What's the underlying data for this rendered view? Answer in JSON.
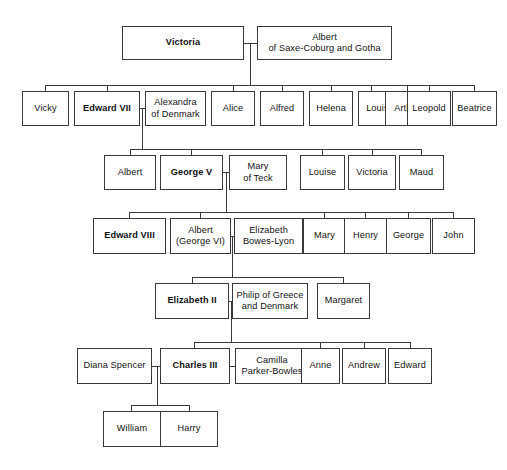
{
  "diagram": {
    "background_color": "#ffffff",
    "line_color": "#3a3a3a",
    "text_color": "#111111"
  },
  "nodes": [
    {
      "id": "victoria",
      "label": "Victoria",
      "monarch": true,
      "x": 122,
      "y": 26,
      "w": 122,
      "h": 34
    },
    {
      "id": "albert_sc",
      "label": "Albert\nof Saxe-Coburg and Gotha",
      "monarch": false,
      "x": 257,
      "y": 26,
      "w": 135,
      "h": 34
    },
    {
      "id": "vicky",
      "label": "Vicky",
      "monarch": false,
      "x": 22,
      "y": 91,
      "w": 47,
      "h": 35
    },
    {
      "id": "edward7",
      "label": "Edward VII",
      "monarch": true,
      "x": 74,
      "y": 91,
      "w": 66,
      "h": 35
    },
    {
      "id": "alexandra",
      "label": "Alexandra\nof Denmark",
      "monarch": false,
      "x": 145,
      "y": 91,
      "w": 61,
      "h": 35
    },
    {
      "id": "alice",
      "label": "Alice",
      "monarch": false,
      "x": 211,
      "y": 91,
      "w": 44,
      "h": 35
    },
    {
      "id": "alfred",
      "label": "Alfred",
      "monarch": false,
      "x": 260,
      "y": 91,
      "w": 44,
      "h": 35
    },
    {
      "id": "helena",
      "label": "Helena",
      "monarch": false,
      "x": 309,
      "y": 91,
      "w": 44,
      "h": 35
    },
    {
      "id": "louise1",
      "label": "Louise",
      "monarch": false,
      "x": 358,
      "y": 91,
      "w": 44,
      "h": 35
    },
    {
      "id": "arthur",
      "label": "Arthur",
      "monarch": false,
      "x": 385,
      "y": 91,
      "w": 44,
      "h": 35
    },
    {
      "id": "leopold",
      "label": "Leopold",
      "monarch": false,
      "x": 407,
      "y": 91,
      "w": 44,
      "h": 35
    },
    {
      "id": "beatrice",
      "label": "Beatrice",
      "monarch": false,
      "x": 452,
      "y": 91,
      "w": 45,
      "h": 35
    },
    {
      "id": "albert2",
      "label": "Albert",
      "monarch": false,
      "x": 104,
      "y": 155,
      "w": 52,
      "h": 35
    },
    {
      "id": "george5",
      "label": "George V",
      "monarch": true,
      "x": 160,
      "y": 155,
      "w": 63,
      "h": 35
    },
    {
      "id": "mary_teck",
      "label": "Mary\nof Teck",
      "monarch": false,
      "x": 229,
      "y": 155,
      "w": 58,
      "h": 35
    },
    {
      "id": "louise2",
      "label": "Louise",
      "monarch": false,
      "x": 300,
      "y": 155,
      "w": 45,
      "h": 35
    },
    {
      "id": "victoria2",
      "label": "Victoria",
      "monarch": false,
      "x": 348,
      "y": 155,
      "w": 48,
      "h": 35
    },
    {
      "id": "maud",
      "label": "Maud",
      "monarch": false,
      "x": 399,
      "y": 155,
      "w": 45,
      "h": 35
    },
    {
      "id": "edward8",
      "label": "Edward VIII",
      "monarch": true,
      "x": 93,
      "y": 218,
      "w": 73,
      "h": 36
    },
    {
      "id": "albert_g6",
      "label": "Albert\n(George VI)",
      "monarch": false,
      "x": 170,
      "y": 218,
      "w": 61,
      "h": 36
    },
    {
      "id": "bowes_lyon",
      "label": "Elizabeth\nBowes-Lyon",
      "monarch": false,
      "x": 234,
      "y": 218,
      "w": 69,
      "h": 36
    },
    {
      "id": "mary2",
      "label": "Mary",
      "monarch": false,
      "x": 303,
      "y": 218,
      "w": 43,
      "h": 36
    },
    {
      "id": "henry",
      "label": "Henry",
      "monarch": false,
      "x": 344,
      "y": 218,
      "w": 43,
      "h": 36
    },
    {
      "id": "george2",
      "label": "George",
      "monarch": false,
      "x": 386,
      "y": 218,
      "w": 45,
      "h": 36
    },
    {
      "id": "john",
      "label": "John",
      "monarch": false,
      "x": 432,
      "y": 218,
      "w": 43,
      "h": 36
    },
    {
      "id": "elizabeth2",
      "label": "Elizabeth II",
      "monarch": true,
      "x": 155,
      "y": 283,
      "w": 74,
      "h": 36
    },
    {
      "id": "philip",
      "label": "Philip of Greece\nand Denmark",
      "monarch": false,
      "x": 232,
      "y": 283,
      "w": 76,
      "h": 36
    },
    {
      "id": "margaret",
      "label": "Margaret",
      "monarch": false,
      "x": 317,
      "y": 283,
      "w": 53,
      "h": 36
    },
    {
      "id": "diana",
      "label": "Diana Spencer",
      "monarch": false,
      "x": 77,
      "y": 348,
      "w": 75,
      "h": 36
    },
    {
      "id": "charles3",
      "label": "Charles III",
      "monarch": true,
      "x": 160,
      "y": 348,
      "w": 70,
      "h": 36
    },
    {
      "id": "camilla",
      "label": "Camilla\nParker-Bowles",
      "monarch": false,
      "x": 235,
      "y": 348,
      "w": 74,
      "h": 36
    },
    {
      "id": "anne",
      "label": "Anne",
      "monarch": false,
      "x": 301,
      "y": 348,
      "w": 39,
      "h": 36
    },
    {
      "id": "andrew",
      "label": "Andrew",
      "monarch": false,
      "x": 342,
      "y": 348,
      "w": 44,
      "h": 36
    },
    {
      "id": "edward_p",
      "label": "Edward",
      "monarch": false,
      "x": 388,
      "y": 348,
      "w": 44,
      "h": 36
    },
    {
      "id": "william",
      "label": "William",
      "monarch": false,
      "x": 103,
      "y": 411,
      "w": 58,
      "h": 36
    },
    {
      "id": "harry",
      "label": "Harry",
      "monarch": false,
      "x": 160,
      "y": 411,
      "w": 58,
      "h": 36
    }
  ],
  "edges": [
    {
      "id": "m-victoria-albert-h",
      "orient": "h",
      "x": 244,
      "y": 43,
      "len": 14
    },
    {
      "id": "m-victoria-albert-v",
      "orient": "v",
      "x": 250,
      "y": 43,
      "len": 42
    },
    {
      "id": "bus-gen2",
      "orient": "h",
      "x": 45,
      "y": 85,
      "len": 430
    },
    {
      "id": "drop-vicky",
      "orient": "v",
      "x": 45,
      "y": 85,
      "len": 6
    },
    {
      "id": "drop-edward7",
      "orient": "v",
      "x": 107,
      "y": 85,
      "len": 6
    },
    {
      "id": "drop-alice",
      "orient": "v",
      "x": 233,
      "y": 85,
      "len": 6
    },
    {
      "id": "drop-alfred",
      "orient": "v",
      "x": 282,
      "y": 85,
      "len": 6
    },
    {
      "id": "drop-helena",
      "orient": "v",
      "x": 331,
      "y": 85,
      "len": 6
    },
    {
      "id": "drop-louise1",
      "orient": "v",
      "x": 371,
      "y": 85,
      "len": 6
    },
    {
      "id": "drop-arthur",
      "orient": "v",
      "x": 407,
      "y": 85,
      "len": 6
    },
    {
      "id": "drop-leopold",
      "orient": "v",
      "x": 429,
      "y": 85,
      "len": 6
    },
    {
      "id": "drop-beatrice",
      "orient": "v",
      "x": 474,
      "y": 85,
      "len": 6
    },
    {
      "id": "m-edward7-alex-h",
      "orient": "h",
      "x": 140,
      "y": 108,
      "len": 5
    },
    {
      "id": "m-edward7-alex-v",
      "orient": "v",
      "x": 142,
      "y": 108,
      "len": 41
    },
    {
      "id": "bus-gen3",
      "orient": "h",
      "x": 130,
      "y": 149,
      "len": 292
    },
    {
      "id": "drop-albert2",
      "orient": "v",
      "x": 130,
      "y": 149,
      "len": 6
    },
    {
      "id": "drop-george5",
      "orient": "v",
      "x": 191,
      "y": 149,
      "len": 6
    },
    {
      "id": "drop-louise2",
      "orient": "v",
      "x": 322,
      "y": 149,
      "len": 6
    },
    {
      "id": "drop-victoria2",
      "orient": "v",
      "x": 372,
      "y": 149,
      "len": 6
    },
    {
      "id": "drop-maud",
      "orient": "v",
      "x": 421,
      "y": 149,
      "len": 6
    },
    {
      "id": "m-george5-mary-h",
      "orient": "h",
      "x": 223,
      "y": 172,
      "len": 6
    },
    {
      "id": "m-george5-mary-v",
      "orient": "v",
      "x": 226,
      "y": 172,
      "len": 40
    },
    {
      "id": "bus-gen4",
      "orient": "h",
      "x": 129,
      "y": 212,
      "len": 325
    },
    {
      "id": "drop-edward8",
      "orient": "v",
      "x": 129,
      "y": 212,
      "len": 6
    },
    {
      "id": "drop-albert-g6",
      "orient": "v",
      "x": 200,
      "y": 212,
      "len": 6
    },
    {
      "id": "drop-mary2",
      "orient": "v",
      "x": 324,
      "y": 212,
      "len": 6
    },
    {
      "id": "drop-henry",
      "orient": "v",
      "x": 365,
      "y": 212,
      "len": 6
    },
    {
      "id": "drop-george2",
      "orient": "v",
      "x": 408,
      "y": 212,
      "len": 6
    },
    {
      "id": "drop-john",
      "orient": "v",
      "x": 453,
      "y": 212,
      "len": 6
    },
    {
      "id": "m-albert-eliz-h",
      "orient": "h",
      "x": 231,
      "y": 236,
      "len": 4
    },
    {
      "id": "m-albert-eliz-v",
      "orient": "v",
      "x": 232,
      "y": 236,
      "len": 41
    },
    {
      "id": "bus-gen5",
      "orient": "h",
      "x": 192,
      "y": 277,
      "len": 152
    },
    {
      "id": "drop-elizabeth2",
      "orient": "v",
      "x": 192,
      "y": 277,
      "len": 6
    },
    {
      "id": "drop-margaret",
      "orient": "v",
      "x": 343,
      "y": 277,
      "len": 6
    },
    {
      "id": "m-eliz-philip-h",
      "orient": "h",
      "x": 229,
      "y": 301,
      "len": 4
    },
    {
      "id": "m-eliz-philip-v",
      "orient": "v",
      "x": 231,
      "y": 301,
      "len": 41
    },
    {
      "id": "bus-gen6",
      "orient": "h",
      "x": 194,
      "y": 342,
      "len": 216
    },
    {
      "id": "drop-charles3",
      "orient": "v",
      "x": 194,
      "y": 342,
      "len": 6
    },
    {
      "id": "drop-anne",
      "orient": "v",
      "x": 320,
      "y": 342,
      "len": 6
    },
    {
      "id": "drop-andrew",
      "orient": "v",
      "x": 364,
      "y": 342,
      "len": 6
    },
    {
      "id": "drop-edward-p",
      "orient": "v",
      "x": 410,
      "y": 342,
      "len": 6
    },
    {
      "id": "m-diana-charles-h",
      "orient": "h",
      "x": 152,
      "y": 366,
      "len": 9
    },
    {
      "id": "m-charles-camilla-h",
      "orient": "h",
      "x": 230,
      "y": 366,
      "len": 6
    },
    {
      "id": "m-charles-kids-v",
      "orient": "v",
      "x": 157,
      "y": 366,
      "len": 40
    },
    {
      "id": "bus-gen7",
      "orient": "h",
      "x": 131,
      "y": 405,
      "len": 58
    },
    {
      "id": "drop-william",
      "orient": "v",
      "x": 131,
      "y": 405,
      "len": 6
    },
    {
      "id": "drop-harry",
      "orient": "v",
      "x": 189,
      "y": 405,
      "len": 6
    }
  ]
}
